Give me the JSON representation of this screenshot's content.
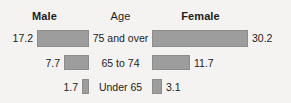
{
  "header": {
    "left_label": "Male",
    "center_label": "Age",
    "right_label": "Female"
  },
  "colors": {
    "bar_fill": "#9d9d9d",
    "bar_border": "#8c8c8c",
    "text": "#1c1c1c",
    "background": "#f4f3f1"
  },
  "chart_data": {
    "type": "bar",
    "title": "",
    "subtitle": "",
    "xlabel": "",
    "ylabel": "Age",
    "orientation": "horizontal",
    "style": "population-pyramid",
    "grid": false,
    "legend_position": "top",
    "categories": [
      "75 and over",
      "65 to 74",
      "Under 65"
    ],
    "series": [
      {
        "name": "Male",
        "side": "left",
        "values": [
          17.2,
          7.7,
          1.7
        ]
      },
      {
        "name": "Female",
        "side": "right",
        "values": [
          30.2,
          11.7,
          3.1
        ]
      }
    ],
    "value_labels": {
      "Male": [
        "17.2",
        "7.7",
        "1.7"
      ],
      "Female": [
        "30.2",
        "11.7",
        "3.1"
      ]
    },
    "xlim": [
      0,
      32
    ],
    "max_value": 30.2
  },
  "rows": [
    {
      "category": "75 and over",
      "male_value": "17.2",
      "female_value": "30.2",
      "male_width_px": 52,
      "female_width_px": 96
    },
    {
      "category": "65 to 74",
      "male_value": "7.7",
      "female_value": "11.7",
      "male_width_px": 25,
      "female_width_px": 38
    },
    {
      "category": "Under 65",
      "male_value": "1.7",
      "female_value": "3.1",
      "male_width_px": 7,
      "female_width_px": 10
    }
  ]
}
